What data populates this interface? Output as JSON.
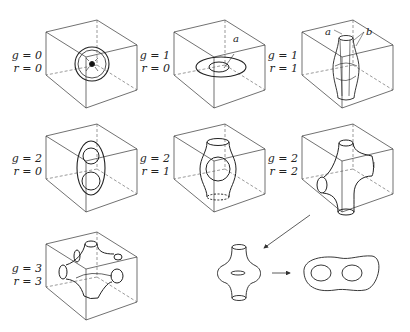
{
  "figure": {
    "panels": [
      {
        "id": "g0r0",
        "g_label": "g = 0",
        "r_label": "r = 0",
        "shape": "sphere"
      },
      {
        "id": "g1r0",
        "g_label": "g = 1",
        "r_label": "r = 0",
        "shape": "torus",
        "annotations": [
          "a"
        ]
      },
      {
        "id": "g1r1",
        "g_label": "g = 1",
        "r_label": "r = 1",
        "shape": "tube-with-handle",
        "annotations": [
          "a",
          "b"
        ]
      },
      {
        "id": "g2r0",
        "g_label": "g = 2",
        "r_label": "r = 0",
        "shape": "double-torus"
      },
      {
        "id": "g2r1",
        "g_label": "g = 2",
        "r_label": "r = 1",
        "shape": "tube-with-hole"
      },
      {
        "id": "g2r2",
        "g_label": "g = 2",
        "r_label": "r = 2",
        "shape": "four-armed-tube"
      },
      {
        "id": "g3r3",
        "g_label": "g = 3",
        "r_label": "r = 3",
        "shape": "six-armed-tube"
      }
    ],
    "bottom_sequence": {
      "description": "Tube with torus collar deforms to genus-2 outline",
      "arrow_from": "g2r2",
      "steps": [
        "collared-tube",
        "double-hole-outline"
      ]
    },
    "colors": {
      "stroke": "#222222",
      "background": "#ffffff"
    }
  }
}
